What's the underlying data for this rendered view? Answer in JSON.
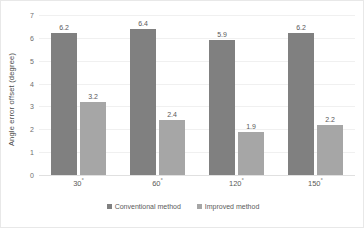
{
  "chart_data": {
    "type": "bar",
    "title": "",
    "subtitle": "",
    "xlabel": "",
    "ylabel": "Angle error offset (degree)",
    "categories": [
      "30°",
      "60°",
      "120°",
      "150°"
    ],
    "series": [
      {
        "name": "Conventional method",
        "color": "#808080",
        "values": [
          6.2,
          6.4,
          5.9,
          6.2
        ],
        "labels": [
          "6.2",
          "6.4",
          "5.9",
          "6.2"
        ]
      },
      {
        "name": "Improved method",
        "color": "#a6a6a6",
        "values": [
          3.2,
          2.4,
          1.9,
          2.2
        ],
        "labels": [
          "3.2",
          "2.4",
          "1.9",
          "2.2"
        ]
      }
    ],
    "ylim": [
      0,
      7
    ],
    "yticks": [
      7,
      6,
      5,
      4,
      3,
      2,
      1,
      0
    ],
    "ytick_labels": [
      "7",
      "6",
      "5",
      "4",
      "3",
      "2",
      "1",
      "0"
    ],
    "grid": true,
    "grid_axis": "y",
    "legend_position": "bottom",
    "background_color": "#ffffff",
    "border_color": "#e8e8e8",
    "gridline_color": "#f0f0f0",
    "axis_text_color": "#5a5a5a"
  }
}
